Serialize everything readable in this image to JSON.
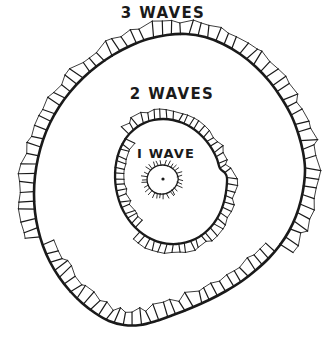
{
  "figure": {
    "background_color": "#ffffff",
    "ink_color": "#1a1a1a",
    "labels": {
      "outer": "3 WAVES",
      "middle": "2 WAVES",
      "inner": "I WAVE"
    }
  },
  "chart_data": {
    "type": "line",
    "xlabel": "",
    "ylabel": "",
    "grid": false,
    "legend": "none",
    "annotations": [
      {
        "text": "3 WAVES",
        "x": 168,
        "y": 14
      },
      {
        "text": "2 WAVES",
        "x": 172,
        "y": 95
      },
      {
        "text": "I WAVE",
        "x": 168,
        "y": 155
      }
    ],
    "source_point": {
      "x": 163,
      "y": 179
    },
    "series": [
      {
        "name": "I WAVE",
        "label": "I WAVE",
        "hatch_side": "outside",
        "center": {
          "x": 163,
          "y": 179
        },
        "mean_radius": 15,
        "tick_count": 30,
        "tick_length": 5,
        "points": [
          {
            "x": 178.2,
            "y": 179.4
          },
          {
            "x": 177.2,
            "y": 183.2
          },
          {
            "x": 175.3,
            "y": 186.8
          },
          {
            "x": 172.6,
            "y": 189.8
          },
          {
            "x": 169.3,
            "y": 192.1
          },
          {
            "x": 165.6,
            "y": 193.6
          },
          {
            "x": 161.6,
            "y": 194.1
          },
          {
            "x": 157.7,
            "y": 193.6
          },
          {
            "x": 154.1,
            "y": 192.1
          },
          {
            "x": 151.0,
            "y": 189.6
          },
          {
            "x": 148.7,
            "y": 186.4
          },
          {
            "x": 147.4,
            "y": 182.7
          },
          {
            "x": 147.1,
            "y": 178.8
          },
          {
            "x": 147.9,
            "y": 175.0
          },
          {
            "x": 149.6,
            "y": 171.5
          },
          {
            "x": 152.2,
            "y": 168.7
          },
          {
            "x": 155.4,
            "y": 166.6
          },
          {
            "x": 159.1,
            "y": 165.3
          },
          {
            "x": 163.0,
            "y": 165.0
          },
          {
            "x": 166.9,
            "y": 165.6
          },
          {
            "x": 170.5,
            "y": 167.1
          },
          {
            "x": 173.6,
            "y": 169.4
          },
          {
            "x": 176.1,
            "y": 172.4
          },
          {
            "x": 177.6,
            "y": 175.8
          }
        ]
      },
      {
        "name": "2 WAVES",
        "label": "2 WAVES",
        "hatch_side": "mixed",
        "center": {
          "x": 163,
          "y": 179
        },
        "mean_radius": 62,
        "tick_count": 62,
        "tick_length": 9,
        "points": [
          {
            "x": 227.0,
            "y": 178.0
          },
          {
            "x": 226.4,
            "y": 189.0
          },
          {
            "x": 224.6,
            "y": 199.6
          },
          {
            "x": 221.4,
            "y": 209.6
          },
          {
            "x": 216.8,
            "y": 218.8
          },
          {
            "x": 210.8,
            "y": 227.0
          },
          {
            "x": 203.5,
            "y": 233.8
          },
          {
            "x": 195.2,
            "y": 239.0
          },
          {
            "x": 186.0,
            "y": 242.4
          },
          {
            "x": 176.3,
            "y": 244.0
          },
          {
            "x": 166.4,
            "y": 243.6
          },
          {
            "x": 156.7,
            "y": 241.3
          },
          {
            "x": 147.5,
            "y": 237.1
          },
          {
            "x": 139.2,
            "y": 231.2
          },
          {
            "x": 131.8,
            "y": 223.8
          },
          {
            "x": 125.6,
            "y": 215.0
          },
          {
            "x": 120.7,
            "y": 205.2
          },
          {
            "x": 117.3,
            "y": 194.6
          },
          {
            "x": 115.4,
            "y": 183.6
          },
          {
            "x": 115.1,
            "y": 172.4
          },
          {
            "x": 116.4,
            "y": 161.4
          },
          {
            "x": 119.3,
            "y": 151.0
          },
          {
            "x": 123.8,
            "y": 141.6
          },
          {
            "x": 129.7,
            "y": 133.6
          },
          {
            "x": 136.9,
            "y": 127.2
          },
          {
            "x": 145.1,
            "y": 122.6
          },
          {
            "x": 154.0,
            "y": 119.9
          },
          {
            "x": 163.4,
            "y": 119.0
          },
          {
            "x": 172.9,
            "y": 120.0
          },
          {
            "x": 182.2,
            "y": 122.8
          },
          {
            "x": 191.0,
            "y": 127.3
          },
          {
            "x": 199.1,
            "y": 133.4
          },
          {
            "x": 206.2,
            "y": 140.8
          },
          {
            "x": 212.2,
            "y": 149.4
          },
          {
            "x": 216.9,
            "y": 158.8
          },
          {
            "x": 220.0,
            "y": 168.4
          },
          {
            "x": 225.0,
            "y": 173.0
          }
        ]
      },
      {
        "name": "3 WAVES",
        "label": "3 WAVES",
        "hatch_side": "mixed",
        "center": {
          "x": 163,
          "y": 179
        },
        "mean_radius": 140,
        "tick_count": 96,
        "tick_length": 14,
        "points": [
          {
            "x": 305.0,
            "y": 168.0
          },
          {
            "x": 304.0,
            "y": 184.0
          },
          {
            "x": 301.0,
            "y": 200.0
          },
          {
            "x": 296.0,
            "y": 216.0
          },
          {
            "x": 289.0,
            "y": 231.0
          },
          {
            "x": 280.0,
            "y": 245.0
          },
          {
            "x": 269.0,
            "y": 258.0
          },
          {
            "x": 256.0,
            "y": 270.0
          },
          {
            "x": 242.0,
            "y": 281.0
          },
          {
            "x": 226.0,
            "y": 291.0
          },
          {
            "x": 209.0,
            "y": 300.0
          },
          {
            "x": 191.0,
            "y": 308.0
          },
          {
            "x": 173.0,
            "y": 315.0
          },
          {
            "x": 156.0,
            "y": 321.0
          },
          {
            "x": 140.0,
            "y": 325.0
          },
          {
            "x": 124.0,
            "y": 325.0
          },
          {
            "x": 109.0,
            "y": 321.0
          },
          {
            "x": 95.0,
            "y": 313.0
          },
          {
            "x": 82.0,
            "y": 303.0
          },
          {
            "x": 70.0,
            "y": 291.0
          },
          {
            "x": 59.0,
            "y": 277.0
          },
          {
            "x": 50.0,
            "y": 262.0
          },
          {
            "x": 43.0,
            "y": 246.0
          },
          {
            "x": 38.0,
            "y": 229.0
          },
          {
            "x": 35.0,
            "y": 212.0
          },
          {
            "x": 34.0,
            "y": 194.0
          },
          {
            "x": 35.0,
            "y": 176.0
          },
          {
            "x": 38.0,
            "y": 158.0
          },
          {
            "x": 43.0,
            "y": 140.0
          },
          {
            "x": 50.0,
            "y": 123.0
          },
          {
            "x": 59.0,
            "y": 107.0
          },
          {
            "x": 70.0,
            "y": 92.0
          },
          {
            "x": 83.0,
            "y": 78.0
          },
          {
            "x": 97.0,
            "y": 66.0
          },
          {
            "x": 113.0,
            "y": 55.0
          },
          {
            "x": 130.0,
            "y": 46.0
          },
          {
            "x": 148.0,
            "y": 39.0
          },
          {
            "x": 167.0,
            "y": 35.0
          },
          {
            "x": 186.0,
            "y": 34.0
          },
          {
            "x": 205.0,
            "y": 37.0
          },
          {
            "x": 223.0,
            "y": 44.0
          },
          {
            "x": 240.0,
            "y": 54.0
          },
          {
            "x": 256.0,
            "y": 67.0
          },
          {
            "x": 270.0,
            "y": 82.0
          },
          {
            "x": 282.0,
            "y": 99.0
          },
          {
            "x": 292.0,
            "y": 117.0
          },
          {
            "x": 299.0,
            "y": 136.0
          },
          {
            "x": 303.0,
            "y": 152.0
          }
        ]
      }
    ]
  }
}
